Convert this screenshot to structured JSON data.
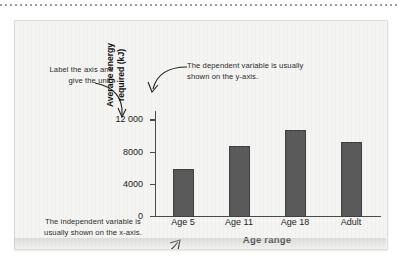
{
  "figure": {
    "background_color": "#f4f4f2",
    "bar_color": "#5a5a5a",
    "axis_color": "#4a4a4a"
  },
  "annotations": {
    "y_axis_note": "Label the axis and give the unit.",
    "dependent_note": "The dependent variable is usually shown on the y-axis.",
    "independent_note": "The independent variable is usually shown on the x-axis."
  },
  "chart_data": {
    "type": "bar",
    "title": "",
    "categories": [
      "Age 5",
      "Age 11",
      "Age 18",
      "Adult"
    ],
    "values": [
      6000,
      8800,
      10800,
      9400
    ],
    "xlabel": "Age range",
    "ylabel": "Average energy\nrequired (kJ)",
    "ylim": [
      0,
      13200
    ],
    "yticks": [
      0,
      4000,
      8000,
      12000
    ],
    "ytick_labels": [
      "0",
      "4000",
      "8000",
      "12 000"
    ],
    "grid": false,
    "legend": "none"
  }
}
